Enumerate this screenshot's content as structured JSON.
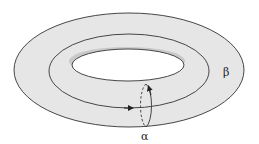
{
  "diagram": {
    "type": "torus",
    "colors": {
      "surface": "#e6e6e6",
      "hole_shadow": "#c9c9c9",
      "stroke": "#333333",
      "background": "#ffffff"
    },
    "labels": {
      "alpha": "α",
      "beta": "β"
    },
    "cycles": [
      {
        "name": "alpha",
        "kind": "meridian",
        "style": "half dashed, half solid"
      },
      {
        "name": "beta",
        "kind": "longitude",
        "style": "solid"
      }
    ]
  }
}
